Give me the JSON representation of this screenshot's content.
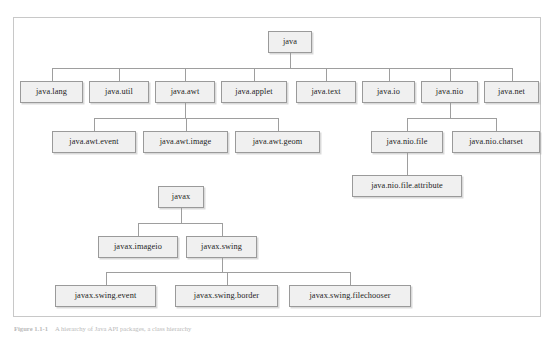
{
  "figure": {
    "caption_label": "Figure 1.1-1",
    "caption_text": "A hierarchy of Java API packages, a class hierarchy",
    "frame_border_color": "#c8c8c8",
    "node_fill_color": "#f0f0f0",
    "node_border_color": "#9a9a9a",
    "connector_color": "#9e9e9e",
    "text_color": "#1d1d1d"
  },
  "tree": {
    "root_java": "java",
    "root_javax": "javax",
    "nodes": [
      {
        "id": "java",
        "label": "java",
        "x": 268,
        "y": 31,
        "w": 44,
        "h": 22
      },
      {
        "id": "java.lang",
        "label": "java.lang",
        "x": 20,
        "y": 81,
        "w": 63,
        "h": 22
      },
      {
        "id": "java.util",
        "label": "java.util",
        "x": 89,
        "y": 81,
        "w": 60,
        "h": 22
      },
      {
        "id": "java.awt",
        "label": "java.awt",
        "x": 155,
        "y": 81,
        "w": 60,
        "h": 22
      },
      {
        "id": "java.applet",
        "label": "java.applet",
        "x": 221,
        "y": 81,
        "w": 66,
        "h": 22
      },
      {
        "id": "java.text",
        "label": "java.text",
        "x": 296,
        "y": 81,
        "w": 60,
        "h": 22
      },
      {
        "id": "java.io",
        "label": "java.io",
        "x": 362,
        "y": 81,
        "w": 53,
        "h": 22
      },
      {
        "id": "java.nio",
        "label": "java.nio",
        "x": 421,
        "y": 81,
        "w": 57,
        "h": 22
      },
      {
        "id": "java.net",
        "label": "java.net",
        "x": 484,
        "y": 81,
        "w": 55,
        "h": 22
      },
      {
        "id": "java.awt.event",
        "label": "java.awt.event",
        "x": 52,
        "y": 131,
        "w": 84,
        "h": 22
      },
      {
        "id": "java.awt.image",
        "label": "java.awt.image",
        "x": 143,
        "y": 131,
        "w": 85,
        "h": 22
      },
      {
        "id": "java.awt.geom",
        "label": "java.awt.geom",
        "x": 235,
        "y": 131,
        "w": 85,
        "h": 22
      },
      {
        "id": "java.nio.file",
        "label": "java.nio.file",
        "x": 371,
        "y": 131,
        "w": 72,
        "h": 22
      },
      {
        "id": "java.nio.charset",
        "label": "java.nio.charset",
        "x": 452,
        "y": 131,
        "w": 88,
        "h": 22
      },
      {
        "id": "java.nio.file.attribute",
        "label": "java.nio.file.attribute",
        "x": 352,
        "y": 175,
        "w": 110,
        "h": 22
      },
      {
        "id": "javax",
        "label": "javax",
        "x": 158,
        "y": 186,
        "w": 46,
        "h": 22
      },
      {
        "id": "javax.imageio",
        "label": "javax.imageio",
        "x": 98,
        "y": 236,
        "w": 80,
        "h": 22
      },
      {
        "id": "javax.swing",
        "label": "javax.swing",
        "x": 186,
        "y": 236,
        "w": 71,
        "h": 22
      },
      {
        "id": "javax.swing.event",
        "label": "javax.swing.event",
        "x": 55,
        "y": 285,
        "w": 101,
        "h": 22
      },
      {
        "id": "javax.swing.border",
        "label": "javax.swing.border",
        "x": 175,
        "y": 285,
        "w": 103,
        "h": 22
      },
      {
        "id": "javax.swing.filechooser",
        "label": "javax.swing.filechooser",
        "x": 289,
        "y": 285,
        "w": 122,
        "h": 22
      }
    ],
    "edges": [
      {
        "from": "java",
        "to": "java.lang"
      },
      {
        "from": "java",
        "to": "java.util"
      },
      {
        "from": "java",
        "to": "java.awt"
      },
      {
        "from": "java",
        "to": "java.applet"
      },
      {
        "from": "java",
        "to": "java.text"
      },
      {
        "from": "java",
        "to": "java.io"
      },
      {
        "from": "java",
        "to": "java.nio"
      },
      {
        "from": "java",
        "to": "java.net"
      },
      {
        "from": "java.awt",
        "to": "java.awt.event"
      },
      {
        "from": "java.awt",
        "to": "java.awt.image"
      },
      {
        "from": "java.awt",
        "to": "java.awt.geom"
      },
      {
        "from": "java.nio",
        "to": "java.nio.file"
      },
      {
        "from": "java.nio",
        "to": "java.nio.charset"
      },
      {
        "from": "java.nio.file",
        "to": "java.nio.file.attribute"
      },
      {
        "from": "javax",
        "to": "javax.imageio"
      },
      {
        "from": "javax",
        "to": "javax.swing"
      },
      {
        "from": "javax.swing",
        "to": "javax.swing.event"
      },
      {
        "from": "javax.swing",
        "to": "javax.swing.border"
      },
      {
        "from": "javax.swing",
        "to": "javax.swing.filechooser"
      }
    ]
  }
}
